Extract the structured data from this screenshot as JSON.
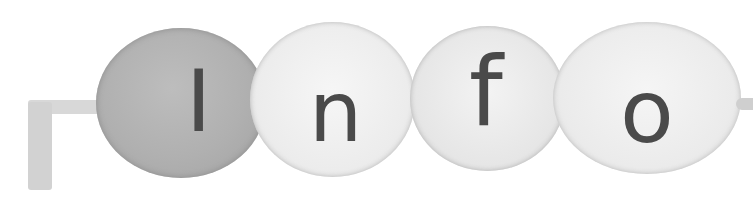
{
  "banner": {
    "title": "Info",
    "letters": [
      "I",
      "n",
      "f",
      "o"
    ],
    "colors": {
      "text": "#4a4a4a",
      "blob_dark": "#b0b0b0",
      "blob_light": "#ececec",
      "background": "#ffffff"
    }
  }
}
